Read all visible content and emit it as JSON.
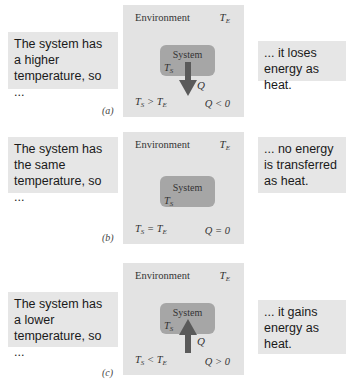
{
  "panels": [
    {
      "id": "a",
      "tag": "(a)",
      "left_text": "The system has a higher temperature, so ...",
      "right_text": "... it loses energy as heat.",
      "environment_label": "Environment",
      "system_label": "System",
      "te": "T",
      "te_sub": "E",
      "ts": "T",
      "ts_sub": "S",
      "relation": "T_S > T_E",
      "relation_op": ">",
      "q_relation": "Q < 0",
      "arrow": "down",
      "q_label": "Q"
    },
    {
      "id": "b",
      "tag": "(b)",
      "left_text": "The system has the same temperature, so ...",
      "right_text": "... no energy is transferred as heat.",
      "environment_label": "Environment",
      "system_label": "System",
      "te": "T",
      "te_sub": "E",
      "ts": "T",
      "ts_sub": "S",
      "relation": "T_S = T_E",
      "relation_op": "=",
      "q_relation": "Q = 0",
      "arrow": "none",
      "q_label": ""
    },
    {
      "id": "c",
      "tag": "(c)",
      "left_text": "The system has a lower temperature, so ...",
      "right_text": "... it gains energy as heat.",
      "environment_label": "Environment",
      "system_label": "System",
      "te": "T",
      "te_sub": "E",
      "ts": "T",
      "ts_sub": "S",
      "relation": "T_S < T_E",
      "relation_op": "<",
      "q_relation": "Q > 0",
      "arrow": "up",
      "q_label": "Q"
    }
  ],
  "colors": {
    "text_box_bg": "#e6e6e6",
    "environment_bg": "#e3e3e3",
    "system_bg": "#a6a6a6",
    "arrow": "#5a5a5a"
  }
}
